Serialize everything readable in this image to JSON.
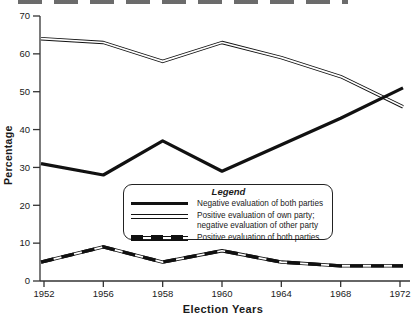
{
  "figure": {
    "ylabel": "Percentage",
    "xlabel": "Election Years"
  },
  "legend": {
    "title": "Legend",
    "items": [
      {
        "id": "negative-both",
        "label": "Negative evaluation of both parties",
        "style": "thick-solid"
      },
      {
        "id": "positive-own-negative-other",
        "label": "Positive evaluation of own party;\nnegative evaluation of other party",
        "style": "double-line"
      },
      {
        "id": "positive-both",
        "label": "Positive evaluation of both parties",
        "style": "double-dashed"
      }
    ]
  },
  "chart_data": {
    "type": "line",
    "title": "",
    "xlabel": "Election Years",
    "ylabel": "Percentage",
    "categories": [
      "1952",
      "1956",
      "1958",
      "1960",
      "1964",
      "1968",
      "1972"
    ],
    "series": [
      {
        "id": "positive-own-negative-other",
        "name": "Positive evaluation of own party; negative evaluation of other party",
        "style": "double-line",
        "values": [
          64,
          63,
          58,
          63,
          59,
          54,
          46
        ]
      },
      {
        "id": "positive-both",
        "name": "Positive evaluation of both parties",
        "style": "double-dashed",
        "values": [
          5,
          9,
          5,
          8,
          5,
          4,
          4
        ]
      },
      {
        "id": "negative-both",
        "name": "Negative evaluation of both parties",
        "style": "thick-solid",
        "values": [
          31,
          28,
          37,
          29,
          36,
          43,
          51
        ]
      }
    ],
    "ylim": [
      0,
      70
    ],
    "yticks": [
      0,
      10,
      20,
      30,
      40,
      50,
      60,
      70
    ],
    "grid": "off",
    "legend_position": "inside-lower-middle",
    "line_color": "#111111",
    "axis_color": "#333333"
  }
}
